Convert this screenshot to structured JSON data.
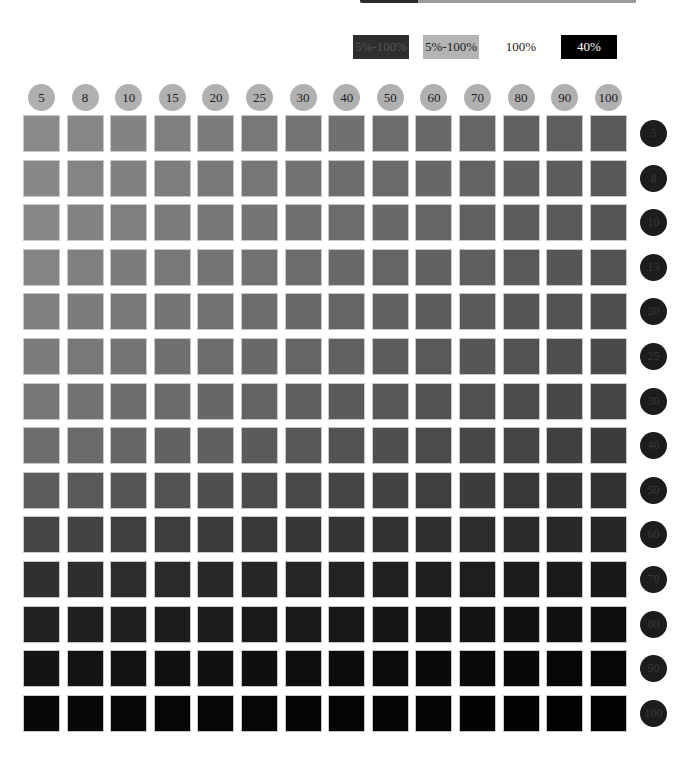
{
  "legend": [
    {
      "label": "5%-100%",
      "bg": "#2e2e2e",
      "fg": "#555555",
      "x": 353,
      "w": 56
    },
    {
      "label": "5%-100%",
      "bg": "#b4b4b4",
      "fg": "#222222",
      "x": 423,
      "w": 56
    },
    {
      "label": "100%",
      "bg": "#ffffff",
      "fg": "#222222",
      "x": 493,
      "w": 56
    },
    {
      "label": "40%",
      "bg": "#000000",
      "fg": "#ffffff",
      "x": 561,
      "w": 56
    }
  ],
  "chart_data": {
    "type": "heatmap",
    "title": "",
    "xlabel": "",
    "ylabel": "",
    "x_categories": [
      "5",
      "8",
      "10",
      "15",
      "20",
      "25",
      "30",
      "40",
      "50",
      "60",
      "70",
      "80",
      "90",
      "100"
    ],
    "y_categories": [
      "5",
      "8",
      "10",
      "15",
      "20",
      "25",
      "30",
      "40",
      "50",
      "60",
      "70",
      "80",
      "90",
      "100"
    ],
    "row_gray_start": [
      138,
      136,
      134,
      132,
      128,
      124,
      118,
      110,
      92,
      68,
      48,
      34,
      20,
      8
    ],
    "row_gray_end": [
      90,
      88,
      86,
      82,
      78,
      74,
      68,
      60,
      50,
      38,
      24,
      14,
      6,
      2
    ],
    "grid": {
      "cols": 14,
      "rows": 14,
      "x0": 23,
      "y0": 115,
      "dx": 43.6,
      "dy": 44.6
    }
  }
}
